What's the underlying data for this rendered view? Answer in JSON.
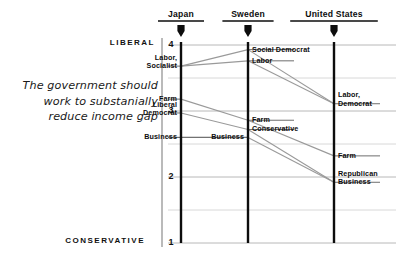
{
  "caption": {
    "line1": "The government should",
    "line2": "work to substanially",
    "line3": "reduce income gap"
  },
  "axis": {
    "pole_top_label": "LIBERAL",
    "pole_bottom_label": "CONSERVATIVE",
    "ticks": [
      "4",
      "3",
      "2",
      "1"
    ]
  },
  "columns": [
    {
      "id": "japan",
      "label": "Japan"
    },
    {
      "id": "sweden",
      "label": "Sweden"
    },
    {
      "id": "united-states",
      "label": "United States"
    }
  ],
  "nodes": {
    "japan": [
      {
        "id": "japan-labor-socialist",
        "label": "Labor,\nSocialist",
        "value": 3.68,
        "side": "left"
      },
      {
        "id": "japan-farm",
        "label": "Farm",
        "value": 3.18,
        "side": "left"
      },
      {
        "id": "japan-liberal-democrat",
        "label": "Liberal\nDemocrat",
        "value": 2.97,
        "side": "left"
      },
      {
        "id": "japan-business",
        "label": "Business",
        "value": 2.6,
        "side": "left"
      }
    ],
    "sweden": [
      {
        "id": "sweden-social-democrat",
        "label": "Social Democrat",
        "value": 3.93,
        "side": "right"
      },
      {
        "id": "sweden-labor",
        "label": "Labor",
        "value": 3.76,
        "side": "right"
      },
      {
        "id": "sweden-farm",
        "label": "Farm",
        "value": 2.86,
        "side": "right"
      },
      {
        "id": "sweden-conservative",
        "label": "Conservative",
        "value": 2.72,
        "side": "right"
      },
      {
        "id": "sweden-business",
        "label": "Business",
        "value": 2.6,
        "side": "left"
      }
    ],
    "united-states": [
      {
        "id": "us-labor-democrat",
        "label": "Labor,\nDemocrat",
        "value": 3.11,
        "side": "right"
      },
      {
        "id": "us-farm",
        "label": "Farm",
        "value": 2.32,
        "side": "right"
      },
      {
        "id": "us-republican-business",
        "label": "Republican\nBusiness",
        "value": 1.92,
        "side": "right"
      }
    ]
  },
  "links": [
    {
      "from": "japan-labor-socialist",
      "to": "sweden-social-democrat"
    },
    {
      "from": "japan-labor-socialist",
      "to": "sweden-labor"
    },
    {
      "from": "japan-farm",
      "to": "sweden-farm"
    },
    {
      "from": "japan-liberal-democrat",
      "to": "sweden-conservative"
    },
    {
      "from": "japan-business",
      "to": "sweden-business"
    },
    {
      "from": "sweden-social-democrat",
      "to": "us-labor-democrat"
    },
    {
      "from": "sweden-labor",
      "to": "us-labor-democrat"
    },
    {
      "from": "sweden-farm",
      "to": "us-farm"
    },
    {
      "from": "sweden-conservative",
      "to": "us-republican-business"
    },
    {
      "from": "sweden-business",
      "to": "us-republican-business"
    }
  ],
  "colors": {
    "axis": "#111111",
    "column_rule": "#0d0d0d",
    "gridline": "#c9c9c9",
    "link": "#9a9a9a",
    "node_rule": "#555555",
    "text": "#0d0d0d"
  },
  "geometry": {
    "plot_left": 168,
    "plot_right": 396,
    "plot_top": 45,
    "plot_bottom": 243,
    "value_top": 4,
    "value_bottom": 1,
    "axis_x": 162,
    "column_x": [
      181,
      248,
      334
    ]
  }
}
